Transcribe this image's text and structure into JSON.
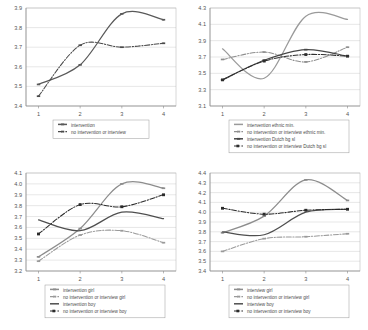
{
  "figure": {
    "panel_count": 4,
    "x_axis_label": "",
    "x_categories": [
      "1",
      "2",
      "3",
      "4"
    ]
  },
  "chart_data": [
    {
      "id": "panel-top-left",
      "type": "line",
      "title": "",
      "xlabel": "",
      "ylabel": "",
      "x": [
        1,
        2,
        3,
        4
      ],
      "xticklabels": [
        "1",
        "2",
        "3",
        "4"
      ],
      "xlim": [
        0.7,
        4.3
      ],
      "ylim": [
        3.4,
        3.9
      ],
      "yticks": [
        3.4,
        3.5,
        3.6,
        3.7,
        3.8,
        3.9
      ],
      "yticklabels": [
        "3.4",
        "3.5",
        "3.6",
        "3.7",
        "3.8",
        "3.9"
      ],
      "grid": true,
      "legend_position": "bottom",
      "series": [
        {
          "name": "intervention",
          "values": [
            3.51,
            3.61,
            3.87,
            3.84
          ],
          "style": "solid",
          "color": "#595959",
          "marker": "dash"
        },
        {
          "name": "no intervention or interview",
          "values": [
            3.45,
            3.71,
            3.7,
            3.72
          ],
          "style": "dashdot",
          "color": "#4a4a4a",
          "marker": "dash"
        }
      ]
    },
    {
      "id": "panel-top-right",
      "type": "line",
      "title": "",
      "xlabel": "",
      "ylabel": "",
      "x": [
        1,
        2,
        3,
        4
      ],
      "xticklabels": [
        "1",
        "2",
        "3",
        "4"
      ],
      "xlim": [
        0.7,
        4.3
      ],
      "ylim": [
        3.1,
        4.3
      ],
      "yticks": [
        3.1,
        3.3,
        3.5,
        3.7,
        3.9,
        4.1,
        4.3
      ],
      "yticklabels": [
        "3.1",
        "3.3",
        "3.5",
        "3.7",
        "3.9",
        "4.1",
        "4.3"
      ],
      "grid": true,
      "legend_position": "bottom",
      "series": [
        {
          "name": "intervention ethnic min.",
          "values": [
            3.8,
            3.44,
            4.2,
            4.16
          ],
          "style": "solid",
          "color": "#9a9a9a",
          "marker": "none"
        },
        {
          "name": "no intervention or interview ethnic min.",
          "values": [
            3.67,
            3.76,
            3.64,
            3.82
          ],
          "style": "dashdot",
          "color": "#8f8f8f",
          "marker": "dash"
        },
        {
          "name": "intervention Dutch  bg sl",
          "values": [
            3.42,
            3.66,
            3.79,
            3.71
          ],
          "style": "solid",
          "color": "#474747",
          "marker": "dash"
        },
        {
          "name": "no intervention or interview Dutch  bg sl",
          "values": [
            3.42,
            3.65,
            3.73,
            3.71
          ],
          "style": "dashdot",
          "color": "#2e2e2e",
          "marker": "square"
        }
      ]
    },
    {
      "id": "panel-bottom-left",
      "type": "line",
      "title": "",
      "xlabel": "",
      "ylabel": "",
      "x": [
        1,
        2,
        3,
        4
      ],
      "xticklabels": [
        "1",
        "2",
        "3",
        "4"
      ],
      "xlim": [
        0.7,
        4.3
      ],
      "ylim": [
        3.2,
        4.1
      ],
      "yticks": [
        3.2,
        3.3,
        3.4,
        3.5,
        3.6,
        3.7,
        3.8,
        3.9,
        4.0,
        4.1
      ],
      "yticklabels": [
        "3.2",
        "3.3",
        "3.4",
        "3.5",
        "3.6",
        "3.7",
        "3.8",
        "3.9",
        "4.0",
        "4.1"
      ],
      "grid": true,
      "legend_position": "bottom",
      "series": [
        {
          "name": "intervention girl",
          "values": [
            3.33,
            3.59,
            4.0,
            3.96
          ],
          "style": "solid",
          "color": "#8d8d8d",
          "marker": "dash"
        },
        {
          "name": "no intervention or interview girl",
          "values": [
            3.29,
            3.53,
            3.57,
            3.46
          ],
          "style": "dashdot",
          "color": "#9a9a9a",
          "marker": "dash"
        },
        {
          "name": "intervention boy",
          "values": [
            3.67,
            3.57,
            3.74,
            3.68
          ],
          "style": "solid",
          "color": "#4f4f4f",
          "marker": "none"
        },
        {
          "name": "no intervention or interview boy",
          "values": [
            3.54,
            3.81,
            3.79,
            3.9
          ],
          "style": "dashdot",
          "color": "#2b2b2b",
          "marker": "square"
        }
      ]
    },
    {
      "id": "panel-bottom-right",
      "type": "line",
      "title": "",
      "xlabel": "",
      "ylabel": "",
      "x": [
        1,
        2,
        3,
        4
      ],
      "xticklabels": [
        "1",
        "2",
        "3",
        "4"
      ],
      "xlim": [
        0.7,
        4.3
      ],
      "ylim": [
        3.4,
        4.4
      ],
      "yticks": [
        3.4,
        3.5,
        3.6,
        3.7,
        3.8,
        3.9,
        4.0,
        4.1,
        4.2,
        4.3,
        4.4
      ],
      "yticklabels": [
        "3.4",
        "3.5",
        "3.6",
        "3.7",
        "3.8",
        "3.9",
        "4.0",
        "4.1",
        "4.2",
        "4.3",
        "4.4"
      ],
      "grid": true,
      "legend_position": "bottom",
      "series": [
        {
          "name": "interview girl",
          "values": [
            3.79,
            3.96,
            4.33,
            4.12
          ],
          "style": "solid",
          "color": "#8d8d8d",
          "marker": "dash"
        },
        {
          "name": "no intervention or interview girl",
          "values": [
            3.6,
            3.73,
            3.75,
            3.78
          ],
          "style": "dashdot",
          "color": "#9a9a9a",
          "marker": "dash"
        },
        {
          "name": "interview boy",
          "values": [
            3.8,
            3.77,
            4.0,
            4.03
          ],
          "style": "solid",
          "color": "#4f4f4f",
          "marker": "none"
        },
        {
          "name": "no intervention or interview boy",
          "values": [
            4.04,
            3.98,
            4.02,
            4.03
          ],
          "style": "dashdot",
          "color": "#2b2b2b",
          "marker": "square"
        }
      ]
    }
  ]
}
